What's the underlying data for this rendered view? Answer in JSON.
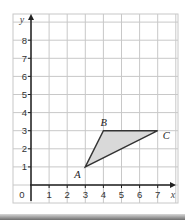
{
  "diagram": {
    "type": "coordinate-grid-triangle",
    "x_axis": {
      "label": "x",
      "ticks": [
        "0",
        "1",
        "2",
        "3",
        "4",
        "5",
        "6",
        "7"
      ],
      "min": 0,
      "max": 7
    },
    "y_axis": {
      "label": "y",
      "ticks": [
        "1",
        "2",
        "3",
        "4",
        "5",
        "6",
        "7",
        "8"
      ],
      "min": 0,
      "max": 8
    },
    "points": [
      {
        "name": "A",
        "x": 3,
        "y": 1
      },
      {
        "name": "B",
        "x": 4,
        "y": 3
      },
      {
        "name": "C",
        "x": 7,
        "y": 3
      }
    ],
    "triangle_fill": "#d9d9d9",
    "grid_color": "#c8c8c8",
    "axis_color": "#222222"
  }
}
